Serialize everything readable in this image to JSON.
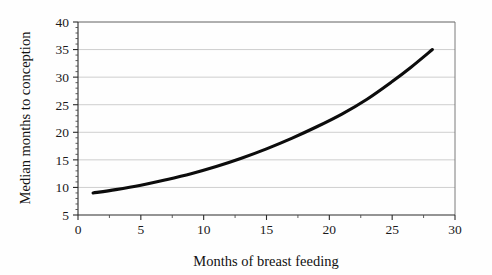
{
  "chart_data": {
    "type": "line",
    "title": "",
    "xlabel": "Months of breast feeding",
    "ylabel": "Median months to conception",
    "xlim": [
      0,
      30
    ],
    "ylim": [
      5,
      40
    ],
    "xticks": [
      0,
      5,
      10,
      15,
      20,
      25,
      30
    ],
    "xtick_labels": [
      "0",
      "5",
      "10",
      "15",
      "20",
      "25",
      "30"
    ],
    "yticks": [
      5,
      10,
      15,
      20,
      25,
      30,
      35,
      40
    ],
    "ytick_labels": [
      "5",
      "10",
      "15",
      "20",
      "25",
      "30",
      "35",
      "40"
    ],
    "grid": "horizontal",
    "legend": "none",
    "series": [
      {
        "name": "Median months to conception",
        "color": "#0c0c0c",
        "x": [
          1.2,
          3,
          5,
          7,
          9,
          11,
          13,
          15,
          17,
          19,
          21,
          23,
          25,
          26.5,
          28.2
        ],
        "y": [
          9.0,
          9.6,
          10.4,
          11.4,
          12.5,
          13.8,
          15.3,
          17.0,
          18.9,
          21.0,
          23.3,
          26.0,
          29.2,
          31.8,
          35.0
        ]
      }
    ]
  },
  "axes": {
    "x_title": "Months of breast feeding",
    "y_title": "Median months to conception"
  }
}
